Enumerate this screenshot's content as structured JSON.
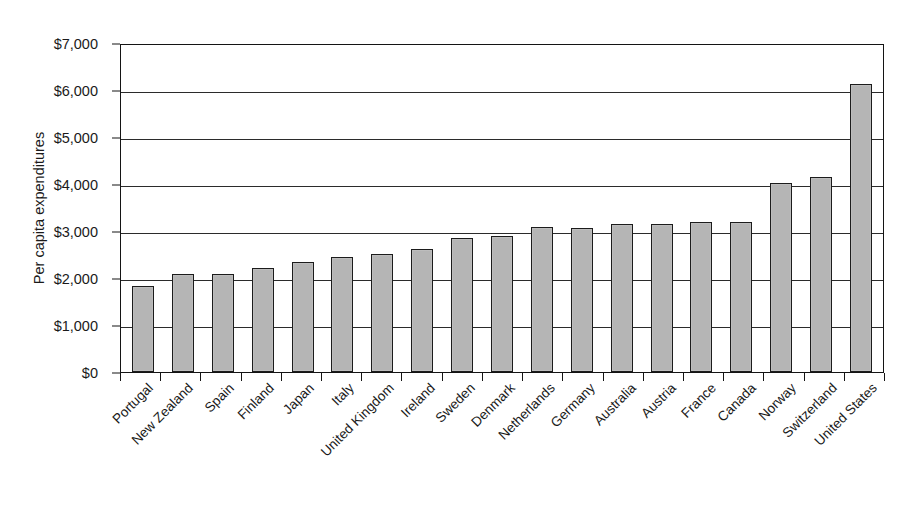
{
  "chart": {
    "type": "bar",
    "ylabel": "Per capita expenditures",
    "xlabel": "",
    "title": ""
  },
  "chart_data": {
    "type": "bar",
    "title": "",
    "xlabel": "",
    "ylabel": "Per capita expenditures",
    "ylim": [
      0,
      7000
    ],
    "ytick_step": 1000,
    "grid": true,
    "legend": false,
    "bar_color": "#b5b5b5",
    "bar_border_color": "#1c1c1c",
    "ytick_labels": [
      "$7,000",
      "$6,000",
      "$5,000",
      "$4,000",
      "$3,000",
      "$2,000",
      "$1,000",
      "$0"
    ],
    "ytick_values": [
      7000,
      6000,
      5000,
      4000,
      3000,
      2000,
      1000,
      0
    ],
    "categories": [
      "Portugal",
      "New Zealand",
      "Spain",
      "Finland",
      "Japan",
      "Italy",
      "United Kingdom",
      "Ireland",
      "Sweden",
      "Denmark",
      "Netherlands",
      "Germany",
      "Australia",
      "Austria",
      "France",
      "Canada",
      "Norway",
      "Switzerland",
      "United States"
    ],
    "values": [
      1830,
      2080,
      2080,
      2210,
      2350,
      2450,
      2510,
      2620,
      2860,
      2900,
      3080,
      3070,
      3140,
      3140,
      3190,
      3190,
      4020,
      4140,
      6130
    ]
  }
}
